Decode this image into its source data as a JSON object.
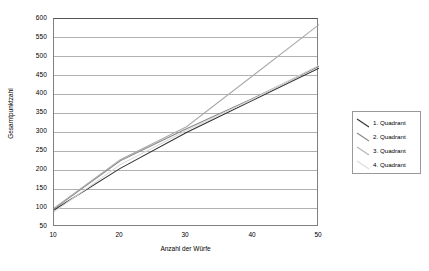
{
  "chart_data": {
    "type": "line",
    "title": "",
    "xlabel": "Anzahl der Würfe",
    "ylabel": "Gesamtpunktzahl",
    "xlim": [
      10,
      50
    ],
    "ylim": [
      50,
      600
    ],
    "xticks": [
      10,
      20,
      30,
      40,
      50
    ],
    "yticks": [
      50,
      100,
      150,
      200,
      250,
      300,
      350,
      400,
      450,
      500,
      550,
      600
    ],
    "grid": true,
    "legend_position": "right",
    "x": [
      10,
      20,
      30,
      40,
      50
    ],
    "series": [
      {
        "name": "1. Quadrant",
        "color": "#333333",
        "values": [
          95,
          205,
          300,
          385,
          470
        ]
      },
      {
        "name": "2. Quadrant",
        "color": "#888888",
        "values": [
          98,
          225,
          310,
          390,
          475
        ]
      },
      {
        "name": "3. Quadrant",
        "color": "#aaaaaa",
        "values": [
          100,
          228,
          315,
          450,
          585
        ]
      },
      {
        "name": "4. Quadrant",
        "color": "#d8d8d8",
        "values": [
          90,
          215,
          305,
          388,
          478
        ]
      }
    ]
  },
  "legend": {
    "items": [
      {
        "label": "1. Quadrant",
        "color": "#333333"
      },
      {
        "label": "2. Quadrant",
        "color": "#888888"
      },
      {
        "label": "3. Quadrant",
        "color": "#aaaaaa"
      },
      {
        "label": "4. Quadrant",
        "color": "#d8d8d8"
      }
    ]
  },
  "axes": {
    "y_title": "Gesamtpunktzahl",
    "x_title": "Anzahl der Würfe",
    "y_labels": [
      "600",
      "550",
      "500",
      "450",
      "400",
      "350",
      "300",
      "250",
      "200",
      "150",
      "100",
      "50"
    ],
    "x_labels": [
      "10",
      "20",
      "30",
      "40",
      "50"
    ]
  }
}
